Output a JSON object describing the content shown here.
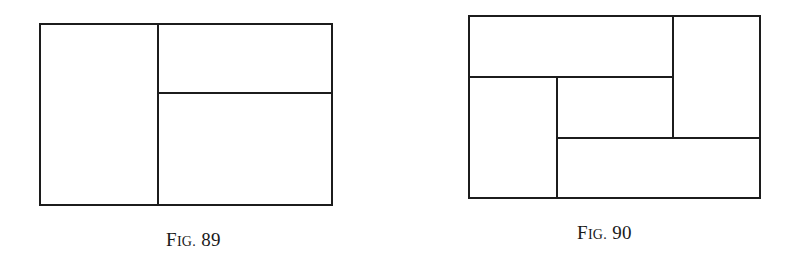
{
  "figures": [
    {
      "id": "fig89",
      "caption": {
        "prefix_cap": "F",
        "prefix_sc": "IG.",
        "number": "89"
      },
      "outer": {
        "x": 39,
        "y": 23,
        "w": 294,
        "h": 183
      },
      "partition_description": "Rectangle split by a vertical line into a left panel and a right panel; right panel split horizontally into an upper and a lower rectangle."
    },
    {
      "id": "fig90",
      "caption": {
        "prefix_cap": "F",
        "prefix_sc": "IG.",
        "number": "90"
      },
      "outer": {
        "x": 468,
        "y": 15,
        "w": 293,
        "h": 184
      },
      "partition_description": "Rectangle partitioned into five rectangles in a pinwheel arrangement: top band, right column, lower-left column, bottom band, and a central rectangle."
    }
  ]
}
